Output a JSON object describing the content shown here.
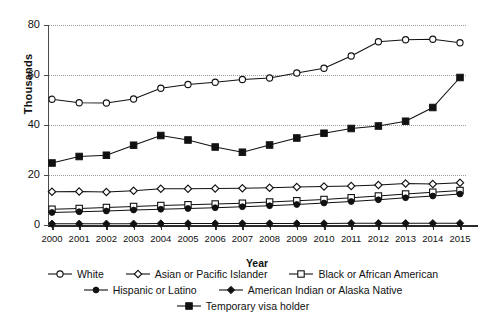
{
  "chart_data": {
    "type": "line",
    "title": "",
    "xlabel": "Year",
    "ylabel": "Thousands",
    "ylim": [
      0,
      80
    ],
    "yticks": [
      0,
      20,
      40,
      60,
      80
    ],
    "grid": true,
    "legend_position": "bottom",
    "categories": [
      "2000",
      "2001",
      "2002",
      "2003",
      "2004",
      "2005",
      "2006",
      "2007",
      "2008",
      "2009",
      "2010",
      "2011",
      "2012",
      "2013",
      "2014",
      "2015"
    ],
    "series": [
      {
        "name": "White",
        "marker": "open-circle",
        "values": [
          50.3,
          48.9,
          48.8,
          50.4,
          54.7,
          56.2,
          57.1,
          58.2,
          58.8,
          60.8,
          62.7,
          67.6,
          73.3,
          74.1,
          74.3,
          72.9
        ]
      },
      {
        "name": "Asian or Pacific Islander",
        "marker": "open-diamond",
        "values": [
          13.3,
          13.4,
          13.2,
          13.7,
          14.5,
          14.5,
          14.6,
          14.7,
          14.9,
          15.2,
          15.4,
          15.6,
          16.0,
          16.6,
          16.4,
          16.9
        ]
      },
      {
        "name": "Black or African American",
        "marker": "open-square",
        "values": [
          6.3,
          6.6,
          7.0,
          7.4,
          7.8,
          8.1,
          8.4,
          8.7,
          9.2,
          9.7,
          10.2,
          10.9,
          11.6,
          12.4,
          13.1,
          13.8
        ]
      },
      {
        "name": "Hispanic or Latino",
        "marker": "filled-circle",
        "values": [
          5.0,
          5.3,
          5.6,
          6.0,
          6.3,
          6.6,
          6.9,
          7.3,
          7.7,
          8.2,
          8.8,
          9.4,
          10.1,
          10.9,
          11.6,
          12.4
        ]
      },
      {
        "name": "American Indian or Alaska Native",
        "marker": "filled-diamond",
        "values": [
          0.5,
          0.5,
          0.5,
          0.5,
          0.6,
          0.6,
          0.6,
          0.6,
          0.6,
          0.6,
          0.6,
          0.7,
          0.7,
          0.7,
          0.7,
          0.7
        ]
      },
      {
        "name": "Temporary visa holder",
        "marker": "filled-square",
        "values": [
          24.8,
          27.4,
          27.9,
          31.9,
          35.8,
          34.0,
          31.2,
          29.1,
          32.0,
          34.8,
          36.7,
          38.6,
          39.6,
          41.5,
          47.0,
          59.0
        ]
      }
    ]
  },
  "legend": {
    "rows": [
      [
        "White",
        "Asian or Pacific Islander",
        "Black or African American"
      ],
      [
        "Hispanic or Latino",
        "American Indian or Alaska Native"
      ],
      [
        "Temporary visa holder"
      ]
    ]
  }
}
